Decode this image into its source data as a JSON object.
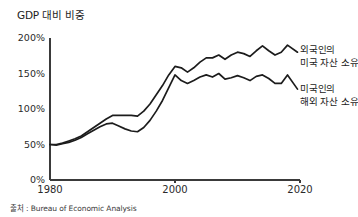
{
  "chart_data": {
    "type": "line",
    "title": "GDP 대비 비중",
    "xlabel": "",
    "ylabel": "",
    "xlim": [
      1980,
      2020
    ],
    "ylim": [
      0,
      200
    ],
    "grid": false,
    "legend_position": "inline-right",
    "x_tick_labels": [
      "1980",
      "2000",
      "2020"
    ],
    "x_ticks": [
      1980,
      2000,
      2020
    ],
    "y_tick_labels": [
      "0%",
      "50%",
      "100%",
      "150%",
      "200%"
    ],
    "y_ticks": [
      0,
      50,
      100,
      150,
      200
    ],
    "x": [
      1980,
      1981,
      1982,
      1983,
      1984,
      1985,
      1986,
      1987,
      1988,
      1989,
      1990,
      1991,
      1992,
      1993,
      1994,
      1995,
      1996,
      1997,
      1998,
      1999,
      2000,
      2001,
      2002,
      2003,
      2004,
      2005,
      2006,
      2007,
      2008,
      2009,
      2010,
      2011,
      2012,
      2013,
      2014,
      2015,
      2016,
      2017,
      2018
    ],
    "series": [
      {
        "name": "외국인의 미국 자산 소유",
        "label_line1": "외국인의",
        "label_line2": "미국 자산 소유",
        "color": "#1c1c1c",
        "values": [
          50,
          50,
          52,
          55,
          58,
          62,
          68,
          74,
          80,
          86,
          91,
          91,
          91,
          91,
          90,
          97,
          107,
          120,
          133,
          148,
          160,
          158,
          152,
          158,
          166,
          172,
          172,
          176,
          170,
          176,
          180,
          178,
          174,
          182,
          189,
          182,
          176,
          180,
          190
        ]
      },
      {
        "name": "미국인의 해외 자산 소유",
        "label_line1": "미국인의",
        "label_line2": "해외 자산 소유",
        "color": "#1c1c1c",
        "values": [
          50,
          49,
          51,
          53,
          56,
          60,
          65,
          70,
          75,
          79,
          80,
          76,
          72,
          69,
          68,
          74,
          84,
          97,
          112,
          130,
          148,
          140,
          136,
          140,
          145,
          148,
          145,
          150,
          142,
          144,
          147,
          144,
          140,
          146,
          148,
          143,
          136,
          136,
          148
        ]
      }
    ],
    "end_annotation": {
      "series_0_end_value": 180,
      "series_1_end_value": 128
    },
    "source": "출처 : Bureau of Economic Analysis"
  },
  "labels": {
    "title": "GDP 대비 비중",
    "source": "출처 : Bureau of Economic Analysis",
    "y_ticks": [
      "200%",
      "150%",
      "100%",
      "50%",
      "0%"
    ],
    "x_ticks": [
      "1980",
      "2000",
      "2020"
    ],
    "series_foreign_owned_us_line1": "외국인의",
    "series_foreign_owned_us_line2": "미국 자산 소유",
    "series_us_owned_foreign_line1": "미국인의",
    "series_us_owned_foreign_line2": "해외 자산 소유"
  }
}
